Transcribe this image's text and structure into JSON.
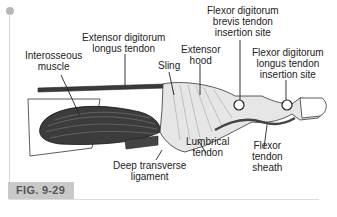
{
  "figure": {
    "number": "FIG. 9-29",
    "labels": {
      "extensor_digitorum_longus": [
        "Extensor digitorum",
        "longus tendon"
      ],
      "interosseous_muscle": [
        "Interosseous",
        "muscle"
      ],
      "sling": [
        "Sling"
      ],
      "extensor_hood": [
        "Extensor",
        "hood"
      ],
      "fdb_insertion": [
        "Flexor digitorum",
        "brevis tendon",
        "insertion site"
      ],
      "fdl_insertion": [
        "Flexor digitorum",
        "longus tendon",
        "insertion site"
      ],
      "lumbrical_tendon": [
        "Lumbrical",
        "tendon"
      ],
      "flexor_tendon_sheath": [
        "Flexor",
        "tendon",
        "sheath"
      ],
      "deep_transverse_ligament": [
        "Deep transverse",
        "ligament"
      ]
    }
  },
  "colors": {
    "fig_tag_bg": "#c9c9c9",
    "fig_tag_text": "#555555",
    "line": "#222222",
    "muscle": "#3a3a3a",
    "tendon_fill": "#d6d6d6"
  }
}
